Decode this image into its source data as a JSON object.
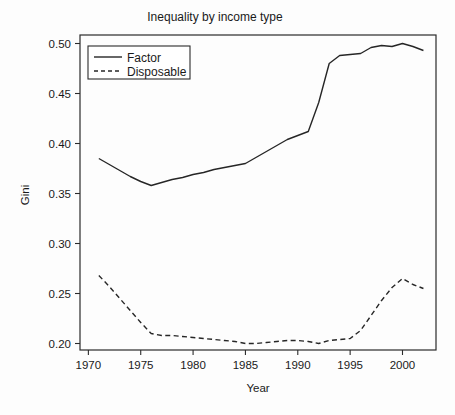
{
  "chart_data": {
    "type": "line",
    "title": "Inequality by income type",
    "xlabel": "Year",
    "ylabel": "Gini",
    "xlim": [
      1969.2,
      2003.2
    ],
    "ylim": [
      0.1935,
      0.5085
    ],
    "grid": false,
    "legend_position": "top-left",
    "xticks": [
      1970,
      1975,
      1980,
      1985,
      1990,
      1995,
      2000
    ],
    "xticklabels": [
      "1970",
      "1975",
      "1980",
      "1985",
      "1990",
      "1995",
      "2000"
    ],
    "yticks": [
      0.2,
      0.25,
      0.3,
      0.35,
      0.4,
      0.45,
      0.5
    ],
    "yticklabels": [
      "0.20",
      "0.25",
      "0.30",
      "0.35",
      "0.40",
      "0.45",
      "0.50"
    ],
    "x": [
      1971,
      1972,
      1973,
      1974,
      1975,
      1976,
      1977,
      1978,
      1979,
      1980,
      1981,
      1982,
      1983,
      1984,
      1985,
      1986,
      1987,
      1988,
      1989,
      1990,
      1991,
      1992,
      1993,
      1994,
      1995,
      1996,
      1997,
      1998,
      1999,
      2000,
      2001,
      2002
    ],
    "series": [
      {
        "name": "Factor",
        "style": "solid",
        "color": "#262626",
        "values": [
          0.385,
          0.379,
          0.373,
          0.367,
          0.362,
          0.358,
          0.361,
          0.364,
          0.366,
          0.369,
          0.371,
          0.374,
          0.376,
          0.378,
          0.38,
          0.386,
          0.392,
          0.398,
          0.404,
          0.408,
          0.412,
          0.441,
          0.48,
          0.488,
          0.489,
          0.49,
          0.496,
          0.498,
          0.497,
          0.5,
          0.497,
          0.493
        ]
      },
      {
        "name": "Disposable",
        "style": "dashed",
        "color": "#262626",
        "values": [
          0.268,
          0.257,
          0.245,
          0.233,
          0.221,
          0.21,
          0.208,
          0.208,
          0.207,
          0.206,
          0.205,
          0.204,
          0.203,
          0.202,
          0.2,
          0.2,
          0.201,
          0.202,
          0.203,
          0.203,
          0.202,
          0.2,
          0.203,
          0.204,
          0.205,
          0.213,
          0.228,
          0.243,
          0.256,
          0.265,
          0.259,
          0.255
        ]
      }
    ]
  },
  "legend": {
    "entries": [
      {
        "label": "Factor"
      },
      {
        "label": "Disposable"
      }
    ]
  }
}
